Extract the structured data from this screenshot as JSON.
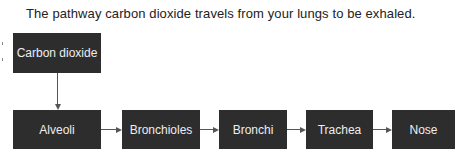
{
  "caption": "The pathway carbon dioxide travels from your lungs to be exhaled.",
  "diagram": {
    "type": "flowchart",
    "nodes": [
      {
        "id": "co2",
        "label": "Carbon dioxide"
      },
      {
        "id": "alveoli",
        "label": "Alveoli"
      },
      {
        "id": "bronchioles",
        "label": "Bronchioles"
      },
      {
        "id": "bronchi",
        "label": "Bronchi"
      },
      {
        "id": "trachea",
        "label": "Trachea"
      },
      {
        "id": "nose",
        "label": "Nose"
      }
    ],
    "edges": [
      {
        "from": "co2",
        "to": "alveoli",
        "direction": "down"
      },
      {
        "from": "alveoli",
        "to": "bronchioles",
        "direction": "right"
      },
      {
        "from": "bronchioles",
        "to": "bronchi",
        "direction": "right"
      },
      {
        "from": "bronchi",
        "to": "trachea",
        "direction": "right"
      },
      {
        "from": "trachea",
        "to": "nose",
        "direction": "right"
      }
    ]
  },
  "colors": {
    "box_fill": "#2d2d2d",
    "box_text": "#eeeeee",
    "connector": "#555555"
  }
}
